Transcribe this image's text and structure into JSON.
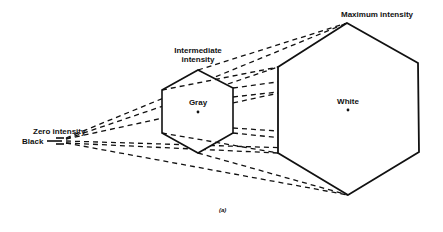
{
  "labels": {
    "zero_intensity": "Zero intensity",
    "black": "Black",
    "intermediate_line1": "Intermediate",
    "intermediate_line2": "intensity",
    "gray": "Gray",
    "maximum_intensity": "Maximum intensity",
    "white": "White",
    "caption": "(a)"
  },
  "geometry": {
    "apex": [
      62,
      141
    ],
    "small_hexagon": [
      [
        198,
        70
      ],
      [
        233,
        88
      ],
      [
        233,
        133
      ],
      [
        198,
        153
      ],
      [
        162,
        133
      ],
      [
        162,
        90
      ]
    ],
    "large_hexagon": [
      [
        347,
        23
      ],
      [
        418,
        63
      ],
      [
        419,
        152
      ],
      [
        348,
        195
      ],
      [
        278,
        153
      ],
      [
        278,
        67
      ]
    ],
    "small_center": [
      198,
      112
    ],
    "large_center": [
      348,
      110
    ]
  },
  "colors": {
    "line": "#111111",
    "background": "#ffffff"
  }
}
